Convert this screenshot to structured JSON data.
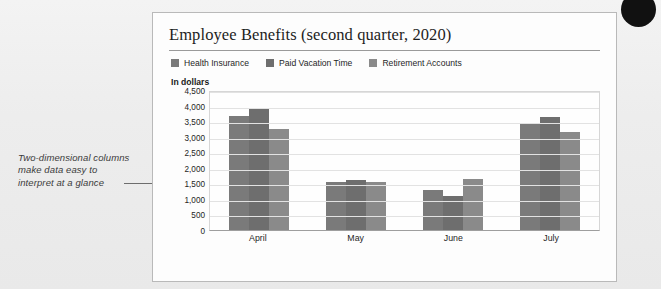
{
  "annotation": {
    "text": "Two-dimensional columns make data easy to interpret at a glance"
  },
  "card": {
    "title": "Employee Benefits (second quarter, 2020)",
    "axis_note": "In dollars"
  },
  "chart_data": {
    "type": "bar",
    "title": "Employee Benefits (second quarter, 2020)",
    "subtitle": "",
    "xlabel": "",
    "ylabel": "In dollars",
    "categories": [
      "April",
      "May",
      "June",
      "July"
    ],
    "series": [
      {
        "name": "Health Insurance",
        "color": "#7a7a7a",
        "values": [
          3650,
          1550,
          1300,
          3400
        ]
      },
      {
        "name": "Paid Vacation Time",
        "color": "#6e6e6e",
        "values": [
          3900,
          1620,
          1100,
          3620
        ]
      },
      {
        "name": "Retirement Accounts",
        "color": "#8a8a8a",
        "values": [
          3250,
          1530,
          1650,
          3150
        ]
      }
    ],
    "ylim": [
      0,
      4500
    ],
    "ytick_step": 500,
    "ytick_labels": [
      "0",
      "500",
      "1,000",
      "1,500",
      "2,000",
      "2,500",
      "3,000",
      "3,500",
      "4,000",
      "4,500"
    ],
    "grid": true,
    "legend_position": "top-left"
  }
}
